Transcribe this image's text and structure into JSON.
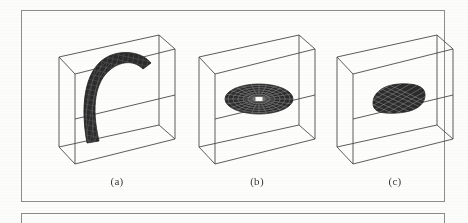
{
  "figure": {
    "kind": "three-panel-3d-wireframe-figure",
    "background_color": "#fcfcfb",
    "frame_color": "#8d8d8d",
    "cube_line_color": "#4a4a4a",
    "surface_color": "#2b2b2b",
    "surface_mesh_color": "#6f6f6f",
    "panels": [
      {
        "id": "a",
        "caption": "(a)",
        "shape_name": "curved-hook-surface",
        "shape_description": "tall dark curved hook / tongue shaped meshed surface rising from the cube floor and bending to the right",
        "mesh": {
          "rows": 22,
          "cols": 9
        }
      },
      {
        "id": "b",
        "caption": "(b)",
        "shape_name": "radial-disc-surface",
        "shape_description": "flat dark elliptical disc with radial spokes and concentric rings and a small white center hole",
        "mesh": {
          "spokes": 36,
          "rings": 7
        }
      },
      {
        "id": "c",
        "caption": "(c)",
        "shape_name": "rounded-square-patch-surface",
        "shape_description": "flat dark rounded-square meshed patch lying horizontally inside the cube",
        "mesh": {
          "rows": 8,
          "cols": 8
        }
      }
    ]
  }
}
